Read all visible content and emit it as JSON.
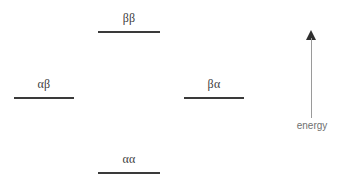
{
  "diagram": {
    "background_color": "#ffffff",
    "line_color": "#3a3a3a",
    "label_color": "#404040",
    "axis_color": "#9a9a9a",
    "axis_label_color": "#707070"
  },
  "levels": [
    {
      "id": "bb",
      "label": "ββ",
      "position": "top-center",
      "energy_rank": 4
    },
    {
      "id": "ab",
      "label": "αβ",
      "position": "middle-left",
      "energy_rank": 3
    },
    {
      "id": "ba",
      "label": "βα",
      "position": "middle-right",
      "energy_rank": 2
    },
    {
      "id": "aa",
      "label": "αα",
      "position": "bottom-center",
      "energy_rank": 1
    }
  ],
  "energy_axis": {
    "label": "energy",
    "direction": "up",
    "arrow_icon": "arrow-up-icon"
  },
  "chart_data": {
    "type": "energy-level",
    "title": "",
    "xlabel": "",
    "ylabel": "energy",
    "categories": [
      "αβ",
      "ββ",
      "αα",
      "βα"
    ],
    "series": [
      {
        "name": "spin states",
        "points": [
          {
            "label": "ββ",
            "x_center": 129,
            "y": 31,
            "width": 62,
            "level": "highest"
          },
          {
            "label": "αβ",
            "x_center": 44,
            "y": 97,
            "width": 60,
            "level": "intermediate"
          },
          {
            "label": "βα",
            "x_center": 214,
            "y": 97,
            "width": 60,
            "level": "intermediate"
          },
          {
            "label": "αα",
            "x_center": 129,
            "y": 172,
            "width": 62,
            "level": "lowest"
          }
        ]
      }
    ],
    "grid": false,
    "legend": "none",
    "annotations": [
      "energy"
    ]
  }
}
